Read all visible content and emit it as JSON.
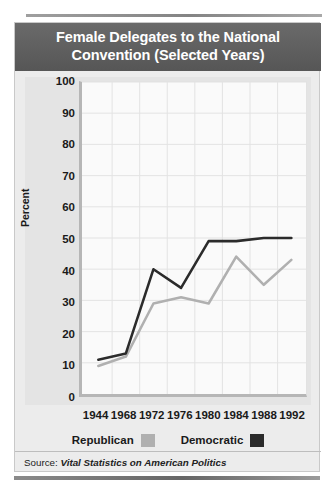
{
  "chart_data": {
    "type": "line",
    "title": "Female Delegates to the National Convention (Selected Years)",
    "xlabel": "",
    "ylabel": "Percent",
    "categories": [
      "1944",
      "1968",
      "1972",
      "1976",
      "1980",
      "1984",
      "1988",
      "1992"
    ],
    "ylim": [
      0,
      100
    ],
    "ytick_labels": [
      "100",
      "90",
      "80",
      "70",
      "60",
      "50",
      "40",
      "30",
      "20",
      "10",
      "0"
    ],
    "ytick_values": [
      100,
      90,
      80,
      70,
      60,
      50,
      40,
      30,
      20,
      10,
      0
    ],
    "grid": true,
    "legend_position": "bottom",
    "series": [
      {
        "name": "Republican",
        "color": "#b0b0b0",
        "values": [
          9,
          12,
          29,
          31,
          29,
          44,
          35,
          43
        ]
      },
      {
        "name": "Democratic",
        "color": "#2b2b2b",
        "values": [
          11,
          13,
          40,
          34,
          49,
          49,
          50,
          50
        ]
      }
    ],
    "source_prefix": "Source:",
    "source_title": "Vital Statistics on American Politics"
  },
  "theme": {
    "title_bar_bg": "#5f5f5f",
    "title_color": "#ffffff",
    "panel_bg": "#ececec",
    "plot_bg": "#fafafa",
    "axis_color": "#b6b6b6",
    "grid_color": "#e3e3e3",
    "text_color": "#1a1a1a"
  }
}
